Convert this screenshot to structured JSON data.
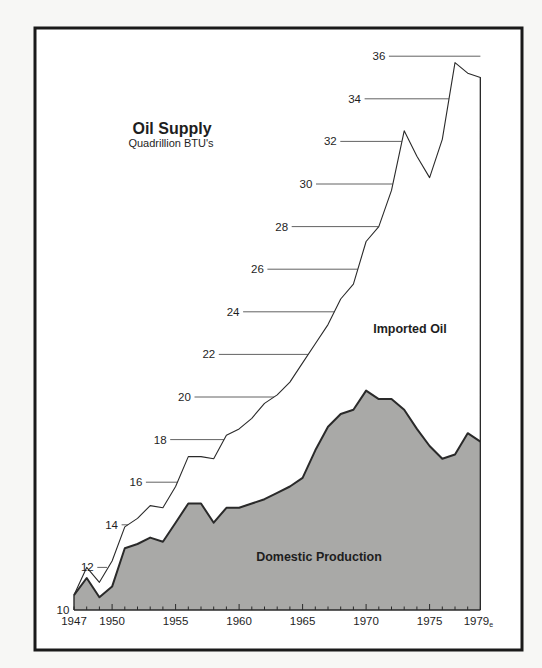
{
  "colors": {
    "background": "#f7f7f5",
    "frame": "#1a1a1a",
    "plot_bg": "#ffffff",
    "domestic_fill": "#a9a9a7",
    "line": "#2a2a2a",
    "gridline": "#3a3a3a",
    "text": "#1e1e1e"
  },
  "chart_data": {
    "type": "area",
    "stacked": true,
    "title": "Oil Supply",
    "subtitle": "Quadrillion BTU's",
    "xlabel": "",
    "ylabel": "Quadrillion BTU's",
    "xlim": [
      1947,
      1979
    ],
    "ylim": [
      10,
      36
    ],
    "x_tick_labels": [
      "1947",
      "1950",
      "1955",
      "1960",
      "1965",
      "1970",
      "1975",
      "1979e"
    ],
    "x_tick_positions": [
      1947,
      1950,
      1955,
      1960,
      1965,
      1970,
      1975,
      1979
    ],
    "y_tick_labels": [
      "10",
      "12",
      "14",
      "16",
      "18",
      "20",
      "22",
      "24",
      "26",
      "28",
      "30",
      "32",
      "34",
      "36"
    ],
    "y_tick_values": [
      10,
      12,
      14,
      16,
      18,
      20,
      22,
      24,
      26,
      28,
      30,
      32,
      34,
      36
    ],
    "grid": "staggered leader lines from labels to total-supply curve",
    "legend": "inline area labels",
    "annotations": [
      {
        "text": "Imported Oil",
        "region": "between domestic and total curves"
      },
      {
        "text": "Domestic Production",
        "region": "shaded lower area"
      }
    ],
    "x": [
      1947,
      1948,
      1949,
      1950,
      1951,
      1952,
      1953,
      1954,
      1955,
      1956,
      1957,
      1958,
      1959,
      1960,
      1961,
      1962,
      1963,
      1964,
      1965,
      1966,
      1967,
      1968,
      1969,
      1970,
      1971,
      1972,
      1973,
      1974,
      1975,
      1976,
      1977,
      1978,
      1979
    ],
    "series": [
      {
        "name": "Domestic Production",
        "style": "filled gray area",
        "values": [
          10.7,
          11.5,
          10.6,
          11.1,
          12.9,
          13.1,
          13.4,
          13.2,
          14.1,
          15.0,
          15.0,
          14.1,
          14.8,
          14.8,
          15.0,
          15.2,
          15.5,
          15.8,
          16.2,
          17.5,
          18.6,
          19.2,
          19.4,
          20.3,
          19.9,
          19.9,
          19.4,
          18.5,
          17.7,
          17.1,
          17.3,
          18.3,
          17.9
        ]
      },
      {
        "name": "Imported Oil",
        "style": "white area between domestic and total",
        "values": [
          0.0,
          0.5,
          0.7,
          1.2,
          1.0,
          1.2,
          1.5,
          1.6,
          1.7,
          2.2,
          2.2,
          3.0,
          3.4,
          3.7,
          4.0,
          4.5,
          4.6,
          4.9,
          5.4,
          5.0,
          4.8,
          5.4,
          5.9,
          7.0,
          8.1,
          9.8,
          13.1,
          12.8,
          12.6,
          15.0,
          18.4,
          16.9,
          17.1
        ]
      },
      {
        "name": "Total Supply",
        "style": "thin outline",
        "values": [
          10.7,
          12.0,
          11.3,
          12.3,
          13.9,
          14.3,
          14.9,
          14.8,
          15.8,
          17.2,
          17.2,
          17.1,
          18.2,
          18.5,
          19.0,
          19.7,
          20.1,
          20.7,
          21.6,
          22.5,
          23.4,
          24.6,
          25.3,
          27.3,
          28.0,
          29.7,
          32.5,
          31.3,
          30.3,
          32.1,
          35.7,
          35.2,
          35.0
        ]
      }
    ]
  }
}
